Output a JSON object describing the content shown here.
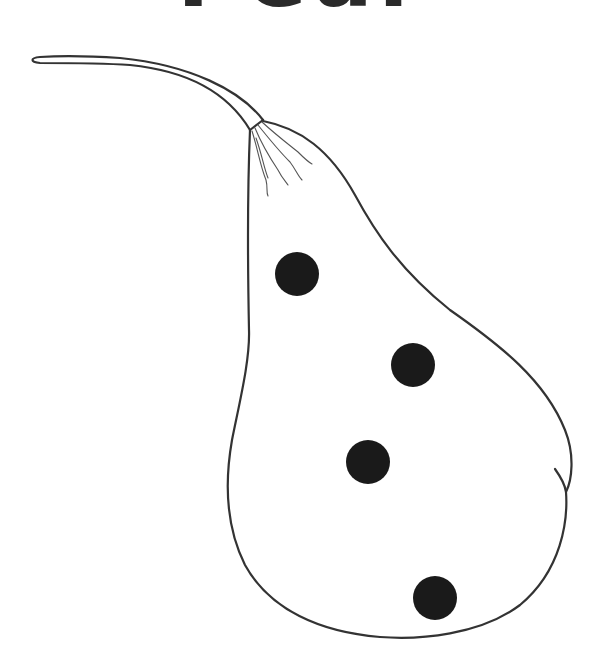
{
  "title": {
    "text": "Pear",
    "note": "cut off at top edge, only bottoms of glyphs visible"
  },
  "illustration": {
    "subject": "pear",
    "style": "black line art coloring page",
    "stroke_color": "#333333",
    "spot_color": "#1a1a1a",
    "background": "#ffffff",
    "spots": [
      {
        "cx": 297,
        "cy": 274,
        "r": 22
      },
      {
        "cx": 413,
        "cy": 365,
        "r": 22
      },
      {
        "cx": 368,
        "cy": 462,
        "r": 22
      },
      {
        "cx": 435,
        "cy": 598,
        "r": 22
      }
    ]
  }
}
